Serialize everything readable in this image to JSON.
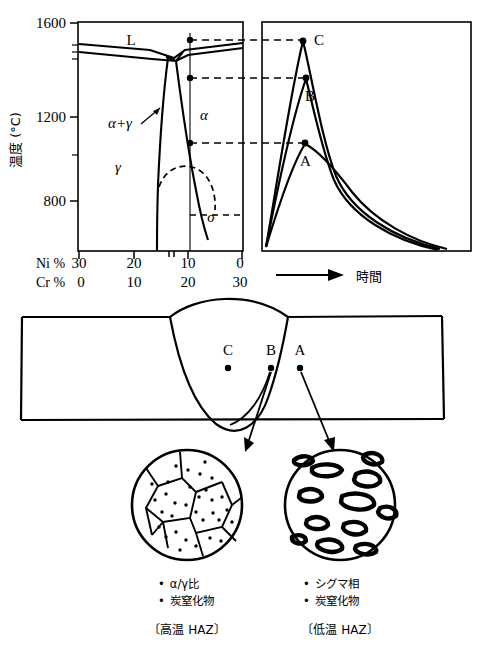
{
  "figure": {
    "kind": "metallurgy-welding-diagram",
    "ink_color": "#000000",
    "background": "#ffffff"
  },
  "phase_diagram": {
    "y_axis_label": "温度 (°C)",
    "y_ticks": [
      "1600",
      "1200",
      "800"
    ],
    "y_tick_values": [
      1600,
      1200,
      800
    ],
    "y_minor_values": [
      1500,
      1450,
      1400,
      1000,
      900
    ],
    "x_rows": [
      {
        "name": "Ni %",
        "label": "Ni %",
        "ticks": [
          "30",
          "20",
          "10",
          "0"
        ],
        "values": [
          30,
          20,
          10,
          0
        ]
      },
      {
        "name": "Cr %",
        "label": "Cr %",
        "ticks": [
          "0",
          "10",
          "20",
          "30"
        ],
        "values": [
          0,
          10,
          20,
          30
        ]
      }
    ],
    "field_labels": [
      {
        "name": "liquid",
        "text": "L"
      },
      {
        "name": "alpha",
        "text": "α"
      },
      {
        "name": "gamma",
        "text": "γ"
      },
      {
        "name": "alpha-gamma",
        "text": "α+γ"
      },
      {
        "name": "sigma",
        "text": "σ"
      }
    ],
    "alloy_line_ni_percent": 6,
    "tie_points": [
      {
        "label": "C",
        "temperature": 1500
      },
      {
        "label": "B",
        "temperature": 1350
      },
      {
        "label": "A",
        "temperature": 1020
      }
    ]
  },
  "thermal_cycle": {
    "x_axis_label": "時間",
    "curves": [
      {
        "name": "C",
        "label": "C",
        "peak_temperature": 1500
      },
      {
        "name": "B",
        "label": "B",
        "peak_temperature": 1350
      },
      {
        "name": "A",
        "label": "A",
        "peak_temperature": 1020
      }
    ]
  },
  "weld_section": {
    "points": [
      {
        "label": "C",
        "zone": "weld-metal"
      },
      {
        "label": "B",
        "zone": "high-temperature-haz"
      },
      {
        "label": "A",
        "zone": "low-temperature-haz"
      }
    ]
  },
  "micrographs": [
    {
      "name": "high-temperature-haz",
      "source_point": "B",
      "bullets": [
        "α/γ比",
        "炭窒化物"
      ],
      "caption": "〔高温 HAZ〕"
    },
    {
      "name": "low-temperature-haz",
      "source_point": "A",
      "bullets": [
        "シグマ相",
        "炭窒化物"
      ],
      "caption": "〔低温 HAZ〕"
    }
  ]
}
